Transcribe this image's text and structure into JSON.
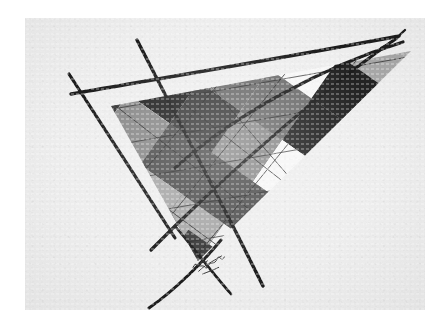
{
  "artwork": {
    "title": "Abstract geometric composition",
    "medium_look": "pencil and ink on paper",
    "paper_color": "#efefef",
    "ink_color": "#1d1d1d",
    "canvas": {
      "width": 447,
      "height": 333
    },
    "paper_bounds": {
      "x": 25,
      "y": 18,
      "width": 400,
      "height": 292
    },
    "signature": {
      "label": "artist-signature",
      "legible": false,
      "text": ""
    }
  },
  "palette": {
    "near_black": "#232323",
    "dark": "#3b3b3b",
    "dark_mid": "#4f4f4f",
    "mid": "#6e6e6e",
    "mid_light": "#8a8a8a",
    "light": "#a8a8a8",
    "pale": "#c8c8c8",
    "paper": "#efefef",
    "white": "#f6f6f6"
  },
  "composition": {
    "main_shape": "triangle",
    "triangle_vertices": [
      {
        "name": "left-vertex",
        "x": 86,
        "y": 88
      },
      {
        "name": "right-apex",
        "x": 386,
        "y": 33
      },
      {
        "name": "bottom-vertex",
        "x": 173,
        "y": 243
      }
    ],
    "pattern": "argyle diamond lattice",
    "overlay_lines": 7
  },
  "chart_data": {
    "type": "scatter",
    "xlabel": "",
    "ylabel": "",
    "note": "Hand-drawn triangle filled with a grayscale argyle diamond lattice; long straight ink strokes overshoot the triangle forming two X crossings at left and bottom, and a narrow V at the right apex.",
    "cells": [
      {
        "id": "c01",
        "tone": "#3b3b3b",
        "row": 0,
        "col": 0
      },
      {
        "id": "c02",
        "tone": "#232323",
        "row": 0,
        "col": 1
      },
      {
        "id": "c03",
        "tone": "#6e6e6e",
        "row": 0,
        "col": 2
      },
      {
        "id": "c04",
        "tone": "#f6f6f6",
        "row": 0,
        "col": 3
      },
      {
        "id": "c05",
        "tone": "#a8a8a8",
        "row": 0,
        "col": 4
      },
      {
        "id": "c06",
        "tone": "#4f4f4f",
        "row": 0,
        "col": 5
      },
      {
        "id": "c07",
        "tone": "#8a8a8a",
        "row": 0,
        "col": 6
      },
      {
        "id": "c08",
        "tone": "#232323",
        "row": 1,
        "col": 0
      },
      {
        "id": "c09",
        "tone": "#6e6e6e",
        "row": 1,
        "col": 1
      },
      {
        "id": "c10",
        "tone": "#c8c8c8",
        "row": 1,
        "col": 2
      },
      {
        "id": "c11",
        "tone": "#3b3b3b",
        "row": 1,
        "col": 3
      },
      {
        "id": "c12",
        "tone": "#f6f6f6",
        "row": 1,
        "col": 4
      },
      {
        "id": "c13",
        "tone": "#6e6e6e",
        "row": 1,
        "col": 5
      },
      {
        "id": "c14",
        "tone": "#a8a8a8",
        "row": 2,
        "col": 0
      },
      {
        "id": "c15",
        "tone": "#4f4f4f",
        "row": 2,
        "col": 1
      },
      {
        "id": "c16",
        "tone": "#f6f6f6",
        "row": 2,
        "col": 2
      },
      {
        "id": "c17",
        "tone": "#8a8a8a",
        "row": 2,
        "col": 3
      },
      {
        "id": "c18",
        "tone": "#3b3b3b",
        "row": 2,
        "col": 4
      },
      {
        "id": "c19",
        "tone": "#6e6e6e",
        "row": 3,
        "col": 0
      },
      {
        "id": "c20",
        "tone": "#232323",
        "row": 3,
        "col": 1
      },
      {
        "id": "c21",
        "tone": "#a8a8a8",
        "row": 3,
        "col": 2
      },
      {
        "id": "c22",
        "tone": "#4f4f4f",
        "row": 4,
        "col": 0
      },
      {
        "id": "c23",
        "tone": "#6e6e6e",
        "row": 4,
        "col": 1
      }
    ]
  }
}
